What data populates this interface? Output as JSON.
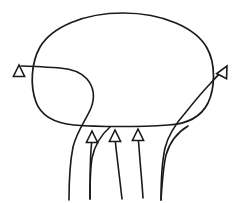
{
  "figure": {
    "background_color": "#ffffff",
    "stroke_color": "#1a1a1a",
    "line_width": 1.6,
    "width": 247,
    "height": 203
  },
  "body_shape": {
    "name": "rounded-oval-body",
    "label": "",
    "fill_color": "#ffffff",
    "stroke_color": "#1a1a1a",
    "bounds": {
      "left": 34,
      "top": 13,
      "right": 213,
      "bottom": 126
    },
    "path": "M 123 13 C 163 13 196 28 207 48 C 216 64 215 88 208 103 C 201 117 188 124 168 125 C 140 127 98 127 74 125 C 54 123 41 116 36 102 C 30 86 31 63 40 47 C 52 27 84 13 123 13 Z"
  },
  "streamlines": [
    {
      "name": "streamline-left-outer",
      "direction": "up-left",
      "arrow": true,
      "arrow_tip": {
        "x": 19,
        "y": 62
      },
      "path": "M 69 200 C 69 180 70 160 73 146 C 77 130 85 120 90 108 C 95 96 92 86 88 80 C 83 72 75 68 63 67 C 48 66 33 66 21 66",
      "shaft_path": "M 69 200 C 69 182 70 162 73 147 C 77 131 86 120 91 108 C 96 95 92 85 87 79 C 81 72 73 69 60 68 C 46 67 32 66 21 66",
      "head": {
        "tip_x": 19,
        "tip_y": 65,
        "angle": -90,
        "size": 11
      }
    },
    {
      "name": "streamline-left-inner",
      "direction": "up",
      "arrow": false,
      "path": "M 90 199 C 90 184 90 170 92 158 C 95 144 102 134 110 127"
    },
    {
      "name": "streamline-center-left",
      "direction": "up",
      "arrow": true,
      "arrow_tip": {
        "x": 92,
        "y": 131
      },
      "path": "M 90 199 C 90 182 90 165 91 150 C 92 141 92 136 92 132",
      "head": {
        "tip_x": 92,
        "tip_y": 131,
        "angle": -90,
        "size": 10
      }
    },
    {
      "name": "streamline-center-middle",
      "direction": "up",
      "arrow": true,
      "arrow_tip": {
        "x": 115,
        "y": 130
      },
      "path": "M 122 199 C 120 182 118 164 116 148 C 115 140 115 135 115 131",
      "head": {
        "tip_x": 115,
        "tip_y": 130,
        "angle": -90,
        "size": 10
      }
    },
    {
      "name": "streamline-center-right",
      "direction": "up",
      "arrow": true,
      "arrow_tip": {
        "x": 138,
        "y": 129
      },
      "path": "M 143 198 C 142 181 140 163 139 147 C 138 139 138 134 138 130",
      "head": {
        "tip_x": 138,
        "tip_y": 129,
        "angle": -90,
        "size": 10
      }
    },
    {
      "name": "streamline-right-outer",
      "direction": "up-right",
      "arrow": true,
      "arrow_tip": {
        "x": 227,
        "y": 66
      },
      "path": "M 161 200 C 161 182 162 162 165 148 C 169 132 178 121 186 112 C 194 102 202 92 210 84 C 216 77 222 71 226 68",
      "head": {
        "tip_x": 227,
        "tip_y": 66,
        "angle": -62,
        "size": 11
      }
    },
    {
      "name": "streamline-right-inner",
      "direction": "up",
      "arrow": false,
      "path": "M 161 200 C 162 184 163 168 166 155 C 170 141 178 132 188 126"
    }
  ],
  "arrowheads": [
    {
      "name": "arrowhead-left",
      "x": 19,
      "y": 65,
      "rotation": 0,
      "style": "open-triangle"
    },
    {
      "name": "arrowhead-center-left",
      "x": 92,
      "y": 131,
      "rotation": 0,
      "style": "open-triangle"
    },
    {
      "name": "arrowhead-center-middle",
      "x": 115,
      "y": 130,
      "rotation": 0,
      "style": "open-triangle"
    },
    {
      "name": "arrowhead-center-right",
      "x": 138,
      "y": 129,
      "rotation": 0,
      "style": "open-triangle"
    },
    {
      "name": "arrowhead-right",
      "x": 227,
      "y": 66,
      "rotation": 28,
      "style": "open-triangle"
    }
  ],
  "annotations": {
    "caption": "",
    "labels": []
  }
}
